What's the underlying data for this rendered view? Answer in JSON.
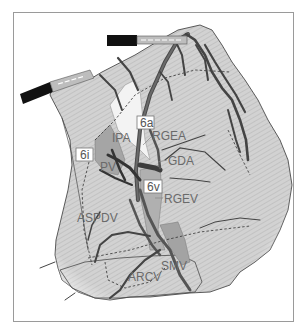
{
  "figure": {
    "type": "surgical-anatomy-illustration",
    "colors": {
      "tissue_fill": "#cfcfcf",
      "tissue_hatch": "#bdbdbd",
      "tissue_outline": "#4a4a4a",
      "vessel": "#555555",
      "vessel_dark": "#3a3a3a",
      "highlight_region": "#f2f2f2",
      "shaded_region": "#a9a9a9",
      "label_text": "#6a6a6a",
      "label_box_fill": "#ffffff",
      "label_box_border": "#777777",
      "forceps": "#111111",
      "frame_border": "#9a9a9a"
    },
    "station_labels": [
      {
        "id": "6a",
        "text": "6a"
      },
      {
        "id": "6i",
        "text": "6i"
      },
      {
        "id": "6v",
        "text": "6v"
      }
    ],
    "vessel_labels": [
      {
        "id": "IPA",
        "text": "IPA"
      },
      {
        "id": "RGEA",
        "text": "RGEA"
      },
      {
        "id": "GDA",
        "text": "GDA"
      },
      {
        "id": "PV",
        "text": "PV"
      },
      {
        "id": "RGEV",
        "text": "RGEV"
      },
      {
        "id": "ASPDV",
        "text": "ASPDV"
      },
      {
        "id": "ARCV",
        "text": "ARCV"
      },
      {
        "id": "SMV",
        "text": "SMV"
      }
    ],
    "instruments": [
      {
        "id": "forceps-left",
        "name": "grasping forceps (left)"
      },
      {
        "id": "forceps-top",
        "name": "grasping forceps (top)"
      }
    ]
  }
}
